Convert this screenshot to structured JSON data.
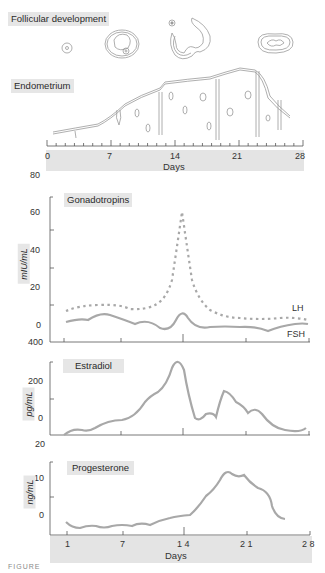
{
  "panels": {
    "follicular": {
      "title": "Follicular development"
    },
    "endometrium": {
      "title": "Endometrium"
    },
    "top_axis": {
      "tick_labels": [
        "0",
        "7",
        "14",
        "21",
        "28"
      ],
      "xlabel": "Days"
    },
    "gonadotropins": {
      "title": "Gonadotropins",
      "ylabel": "mIU/mL",
      "yticks": [
        "60",
        "40",
        "20",
        "0"
      ],
      "stray_top_label": "80",
      "stray_bottom_label": "400",
      "series_labels": {
        "lh": "LH",
        "fsh": "FSH"
      }
    },
    "estradiol": {
      "title": "Estradiol",
      "ylabel": "pg/mL",
      "yticks": [
        "200",
        "0"
      ],
      "stray_bottom_label": "20"
    },
    "progesterone": {
      "title": "Progesterone",
      "ylabel": "ng/mL",
      "yticks": [
        "10",
        "0"
      ]
    },
    "bottom_axis": {
      "tick_labels": [
        "1",
        "7",
        "1 4",
        "2 1",
        "2 8"
      ],
      "xlabel": "Days"
    }
  },
  "caption": "FIGURE",
  "colors": {
    "curve": "#a8a8a8",
    "axis": "#555555",
    "band": "#e4e4e4",
    "drawing": "#9a9a9a"
  },
  "chart_data": [
    {
      "type": "line",
      "title": "Gonadotropins",
      "xlabel": "Days",
      "ylabel": "mIU/mL",
      "x": [
        1,
        3,
        5,
        7,
        9,
        11,
        12,
        13,
        14,
        15,
        16,
        17,
        19,
        21,
        23,
        25,
        27,
        28
      ],
      "series": [
        {
          "name": "LH",
          "style": "dotted",
          "values": [
            8,
            9,
            10,
            10,
            9,
            10,
            12,
            25,
            62,
            25,
            12,
            9,
            6,
            6,
            5,
            5,
            6,
            6
          ]
        },
        {
          "name": "FSH",
          "style": "solid",
          "values": [
            3,
            4,
            6,
            4,
            3,
            4,
            1,
            4,
            9,
            4,
            2,
            2,
            2,
            2,
            1,
            1,
            3,
            3
          ]
        }
      ],
      "ylim": [
        0,
        80
      ],
      "grid": false,
      "legend": "inline right"
    },
    {
      "type": "line",
      "title": "Estradiol",
      "xlabel": "Days",
      "ylabel": "pg/mL",
      "x": [
        1,
        2,
        3,
        5,
        7,
        9,
        11,
        12,
        13,
        14,
        15,
        16,
        17,
        18,
        19,
        20,
        21,
        22,
        23,
        24,
        25,
        26,
        27,
        28
      ],
      "series": [
        {
          "name": "Estradiol",
          "values": [
            5,
            20,
            15,
            45,
            55,
            90,
            170,
            210,
            280,
            360,
            200,
            60,
            80,
            65,
            200,
            170,
            140,
            100,
            115,
            90,
            50,
            25,
            15,
            20
          ]
        }
      ],
      "ylim": [
        0,
        400
      ],
      "grid": false
    },
    {
      "type": "line",
      "title": "Progesterone",
      "xlabel": "Days",
      "ylabel": "ng/mL",
      "x": [
        1,
        2,
        3,
        4,
        5,
        6,
        7,
        9,
        10,
        11,
        12,
        13,
        14,
        15,
        16,
        17,
        18,
        19,
        20,
        21,
        22,
        23,
        24,
        25,
        26,
        27,
        28
      ],
      "series": [
        {
          "name": "Progesterone",
          "values": [
            1,
            0,
            0.5,
            0.8,
            0,
            0.3,
            0.5,
            0.5,
            1,
            0.5,
            1,
            1.5,
            2,
            2.3,
            2.5,
            3,
            7,
            10,
            12,
            15,
            13,
            13.5,
            11,
            10,
            9,
            4,
            3
          ]
        }
      ],
      "ylim": [
        0,
        20
      ],
      "grid": false
    }
  ]
}
